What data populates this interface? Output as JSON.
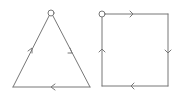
{
  "diagram": {
    "stroke_color": "#777777",
    "triangle": {
      "vertices": [
        [
          51,
          12
        ],
        [
          13,
          87
        ],
        [
          90,
          87
        ]
      ],
      "start_point": [
        51,
        12
      ],
      "arrows": [
        "up-left edge pointing up",
        "right edge pointing down",
        "bottom edge pointing left"
      ]
    },
    "square": {
      "vertices": [
        [
          102,
          14
        ],
        [
          168,
          14
        ],
        [
          168,
          86
        ],
        [
          102,
          86
        ]
      ],
      "start_point": [
        102,
        14
      ],
      "arrows": [
        "top edge pointing right",
        "right edge pointing down",
        "bottom edge pointing left",
        "left edge pointing up"
      ]
    }
  }
}
